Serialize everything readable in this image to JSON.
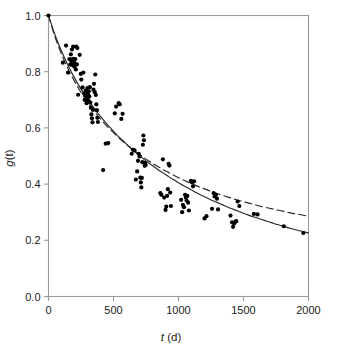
{
  "chart_data": {
    "type": "scatter",
    "title": "",
    "xlabel": "t (d)",
    "xlabel_italic_part": "t",
    "xlabel_rest": " (d)",
    "ylabel": "g(t)",
    "ylabel_italic_part": "g",
    "ylabel_rest": "(t)",
    "xlim": [
      0,
      2000
    ],
    "ylim": [
      0.0,
      1.0
    ],
    "xticks": [
      0,
      500,
      1000,
      1500,
      2000
    ],
    "xticklabels": [
      "0",
      "500",
      "1000",
      "1500",
      "2000"
    ],
    "yticks": [
      0.0,
      0.2,
      0.4,
      0.6,
      0.8,
      1.0
    ],
    "yticklabels": [
      "0.0",
      "0.2",
      "0.4",
      "0.6",
      "0.8",
      "1.0"
    ],
    "grid": false,
    "legend": null,
    "marker": {
      "shape": "circle",
      "color": "#000000",
      "size_px": 4.2
    },
    "frame_color": "#9a9a9a",
    "points": [
      [
        0,
        1.0
      ],
      [
        110,
        0.832
      ],
      [
        135,
        0.893
      ],
      [
        150,
        0.797
      ],
      [
        160,
        0.845
      ],
      [
        168,
        0.826
      ],
      [
        172,
        0.862
      ],
      [
        176,
        0.838
      ],
      [
        180,
        0.879
      ],
      [
        184,
        0.823
      ],
      [
        188,
        0.846
      ],
      [
        190,
        0.889
      ],
      [
        194,
        0.822
      ],
      [
        197,
        0.834
      ],
      [
        200,
        0.818
      ],
      [
        203,
        0.826
      ],
      [
        206,
        0.845
      ],
      [
        210,
        0.808
      ],
      [
        214,
        0.889
      ],
      [
        218,
        0.826
      ],
      [
        222,
        0.884
      ],
      [
        228,
        0.718
      ],
      [
        240,
        0.86
      ],
      [
        248,
        0.792
      ],
      [
        252,
        0.772
      ],
      [
        262,
        0.744
      ],
      [
        268,
        0.797
      ],
      [
        274,
        0.722
      ],
      [
        278,
        0.7
      ],
      [
        282,
        0.716
      ],
      [
        286,
        0.733
      ],
      [
        290,
        0.726
      ],
      [
        293,
        0.688
      ],
      [
        296,
        0.706
      ],
      [
        300,
        0.742
      ],
      [
        303,
        0.72
      ],
      [
        306,
        0.698
      ],
      [
        310,
        0.73
      ],
      [
        314,
        0.712
      ],
      [
        318,
        0.745
      ],
      [
        322,
        0.69
      ],
      [
        326,
        0.672
      ],
      [
        330,
        0.648
      ],
      [
        334,
        0.634
      ],
      [
        338,
        0.62
      ],
      [
        342,
        0.664
      ],
      [
        346,
        0.736
      ],
      [
        350,
        0.757
      ],
      [
        356,
        0.727
      ],
      [
        360,
        0.79
      ],
      [
        364,
        0.717
      ],
      [
        368,
        0.684
      ],
      [
        372,
        0.663
      ],
      [
        376,
        0.636
      ],
      [
        380,
        0.621
      ],
      [
        420,
        0.45
      ],
      [
        440,
        0.544
      ],
      [
        460,
        0.546
      ],
      [
        510,
        0.652
      ],
      [
        520,
        0.676
      ],
      [
        540,
        0.688
      ],
      [
        548,
        0.684
      ],
      [
        560,
        0.632
      ],
      [
        570,
        0.65
      ],
      [
        640,
        0.508
      ],
      [
        650,
        0.522
      ],
      [
        662,
        0.52
      ],
      [
        672,
        0.416
      ],
      [
        682,
        0.445
      ],
      [
        688,
        0.483
      ],
      [
        694,
        0.508
      ],
      [
        700,
        0.498
      ],
      [
        706,
        0.423
      ],
      [
        710,
        0.406
      ],
      [
        714,
        0.388
      ],
      [
        718,
        0.422
      ],
      [
        722,
        0.478
      ],
      [
        726,
        0.54
      ],
      [
        730,
        0.573
      ],
      [
        734,
        0.556
      ],
      [
        740,
        0.465
      ],
      [
        744,
        0.476
      ],
      [
        748,
        0.468
      ],
      [
        860,
        0.368
      ],
      [
        868,
        0.362
      ],
      [
        880,
        0.488
      ],
      [
        890,
        0.352
      ],
      [
        900,
        0.308
      ],
      [
        906,
        0.32
      ],
      [
        912,
        0.358
      ],
      [
        918,
        0.382
      ],
      [
        924,
        0.472
      ],
      [
        930,
        0.466
      ],
      [
        936,
        0.37
      ],
      [
        942,
        0.322
      ],
      [
        1020,
        0.344
      ],
      [
        1028,
        0.3
      ],
      [
        1034,
        0.326
      ],
      [
        1042,
        0.318
      ],
      [
        1050,
        0.362
      ],
      [
        1056,
        0.352
      ],
      [
        1062,
        0.342
      ],
      [
        1068,
        0.358
      ],
      [
        1074,
        0.334
      ],
      [
        1080,
        0.306
      ],
      [
        1096,
        0.412
      ],
      [
        1104,
        0.406
      ],
      [
        1112,
        0.392
      ],
      [
        1120,
        0.41
      ],
      [
        1200,
        0.278
      ],
      [
        1215,
        0.286
      ],
      [
        1258,
        0.312
      ],
      [
        1270,
        0.368
      ],
      [
        1278,
        0.356
      ],
      [
        1288,
        0.362
      ],
      [
        1296,
        0.348
      ],
      [
        1304,
        0.31
      ],
      [
        1400,
        0.288
      ],
      [
        1412,
        0.264
      ],
      [
        1420,
        0.248
      ],
      [
        1428,
        0.26
      ],
      [
        1436,
        0.266
      ],
      [
        1444,
        0.268
      ],
      [
        1455,
        0.338
      ],
      [
        1468,
        0.322
      ],
      [
        1580,
        0.294
      ],
      [
        1608,
        0.292
      ],
      [
        1810,
        0.25
      ],
      [
        1960,
        0.226
      ]
    ],
    "curves": [
      {
        "name": "solid-fit-curve",
        "style": "solid",
        "color": "#2a2a2a",
        "width_px": 1.15,
        "points": [
          [
            0,
            1.0
          ],
          [
            40,
            0.944
          ],
          [
            80,
            0.895
          ],
          [
            120,
            0.852
          ],
          [
            160,
            0.813
          ],
          [
            200,
            0.778
          ],
          [
            240,
            0.746
          ],
          [
            280,
            0.717
          ],
          [
            320,
            0.69
          ],
          [
            360,
            0.664
          ],
          [
            400,
            0.641
          ],
          [
            440,
            0.619
          ],
          [
            480,
            0.598
          ],
          [
            520,
            0.578
          ],
          [
            560,
            0.56
          ],
          [
            600,
            0.542
          ],
          [
            640,
            0.525
          ],
          [
            680,
            0.509
          ],
          [
            720,
            0.494
          ],
          [
            760,
            0.479
          ],
          [
            800,
            0.466
          ],
          [
            840,
            0.452
          ],
          [
            880,
            0.44
          ],
          [
            920,
            0.428
          ],
          [
            960,
            0.416
          ],
          [
            1000,
            0.405
          ],
          [
            1040,
            0.394
          ],
          [
            1080,
            0.384
          ],
          [
            1120,
            0.374
          ],
          [
            1160,
            0.364
          ],
          [
            1200,
            0.355
          ],
          [
            1240,
            0.346
          ],
          [
            1280,
            0.338
          ],
          [
            1320,
            0.33
          ],
          [
            1360,
            0.322
          ],
          [
            1400,
            0.314
          ],
          [
            1440,
            0.307
          ],
          [
            1480,
            0.3
          ],
          [
            1520,
            0.293
          ],
          [
            1560,
            0.286
          ],
          [
            1600,
            0.28
          ],
          [
            1640,
            0.274
          ],
          [
            1680,
            0.268
          ],
          [
            1720,
            0.262
          ],
          [
            1760,
            0.256
          ],
          [
            1800,
            0.251
          ],
          [
            1840,
            0.245
          ],
          [
            1880,
            0.24
          ],
          [
            1920,
            0.235
          ],
          [
            1960,
            0.231
          ],
          [
            2000,
            0.226
          ]
        ]
      },
      {
        "name": "dashed-fit-curve",
        "style": "dashed",
        "color": "#2a2a2a",
        "width_px": 1.15,
        "dash_pattern": "7,4",
        "points": [
          [
            0,
            1.0
          ],
          [
            40,
            0.938
          ],
          [
            80,
            0.886
          ],
          [
            120,
            0.841
          ],
          [
            160,
            0.801
          ],
          [
            200,
            0.766
          ],
          [
            240,
            0.734
          ],
          [
            280,
            0.705
          ],
          [
            320,
            0.679
          ],
          [
            360,
            0.654
          ],
          [
            400,
            0.632
          ],
          [
            440,
            0.611
          ],
          [
            480,
            0.592
          ],
          [
            520,
            0.574
          ],
          [
            560,
            0.557
          ],
          [
            600,
            0.541
          ],
          [
            640,
            0.526
          ],
          [
            680,
            0.512
          ],
          [
            720,
            0.499
          ],
          [
            760,
            0.486
          ],
          [
            800,
            0.474
          ],
          [
            840,
            0.463
          ],
          [
            880,
            0.452
          ],
          [
            920,
            0.442
          ],
          [
            960,
            0.432
          ],
          [
            1000,
            0.423
          ],
          [
            1040,
            0.414
          ],
          [
            1080,
            0.406
          ],
          [
            1120,
            0.398
          ],
          [
            1160,
            0.39
          ],
          [
            1200,
            0.383
          ],
          [
            1240,
            0.376
          ],
          [
            1280,
            0.369
          ],
          [
            1320,
            0.363
          ],
          [
            1360,
            0.357
          ],
          [
            1400,
            0.351
          ],
          [
            1440,
            0.345
          ],
          [
            1480,
            0.34
          ],
          [
            1520,
            0.335
          ],
          [
            1560,
            0.33
          ],
          [
            1600,
            0.325
          ],
          [
            1640,
            0.32
          ],
          [
            1680,
            0.316
          ],
          [
            1720,
            0.312
          ],
          [
            1760,
            0.308
          ],
          [
            1800,
            0.304
          ],
          [
            1840,
            0.3
          ],
          [
            1880,
            0.296
          ],
          [
            1920,
            0.293
          ],
          [
            1960,
            0.289
          ],
          [
            2000,
            0.286
          ]
        ]
      }
    ]
  }
}
